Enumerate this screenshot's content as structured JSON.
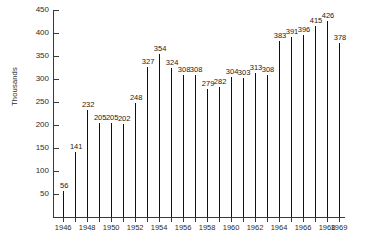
{
  "chart_data": {
    "type": "bar",
    "title": "",
    "subtitle": "",
    "xlabel": "",
    "ylabel": "Thousands",
    "categories": [
      "1946",
      "1947",
      "1948",
      "1949",
      "1950",
      "1951",
      "1952",
      "1953",
      "1954",
      "1955",
      "1956",
      "1957",
      "1958",
      "1959",
      "1960",
      "1961",
      "1962",
      "1963",
      "1964",
      "1965",
      "1966",
      "1967",
      "1968",
      "1969"
    ],
    "values": [
      56,
      141,
      232,
      205,
      205,
      202,
      248,
      327,
      354,
      324,
      308,
      308,
      279,
      282,
      304,
      303,
      313,
      308,
      383,
      391,
      396,
      415,
      426,
      378
    ],
    "data_labels": [
      "56",
      "141",
      "232",
      "205",
      "205",
      "202",
      "248",
      "327",
      "354",
      "324",
      "308",
      "308",
      "279",
      "282",
      "304",
      "303",
      "313",
      "308",
      "383",
      "391",
      "396",
      "415",
      "426",
      "378"
    ],
    "x_tick_labels": [
      "1946",
      "",
      "1948",
      "",
      "1950",
      "",
      "1952",
      "",
      "1954",
      "",
      "1956",
      "",
      "1958",
      "",
      "1960",
      "",
      "1962",
      "",
      "1964",
      "",
      "1966",
      "",
      "1968",
      "1969"
    ],
    "y_ticks": [
      50,
      100,
      150,
      200,
      250,
      300,
      350,
      400,
      450
    ],
    "y_tick_labels": [
      "50",
      "100",
      "150",
      "200",
      "250",
      "300",
      "350",
      "400",
      "450"
    ],
    "ylim": [
      0,
      450
    ],
    "grid": false,
    "legend": false,
    "legend_position": "none",
    "bar_color": "#111111",
    "axis_color": "#3a3a3a",
    "background_color": "#ffffff"
  }
}
